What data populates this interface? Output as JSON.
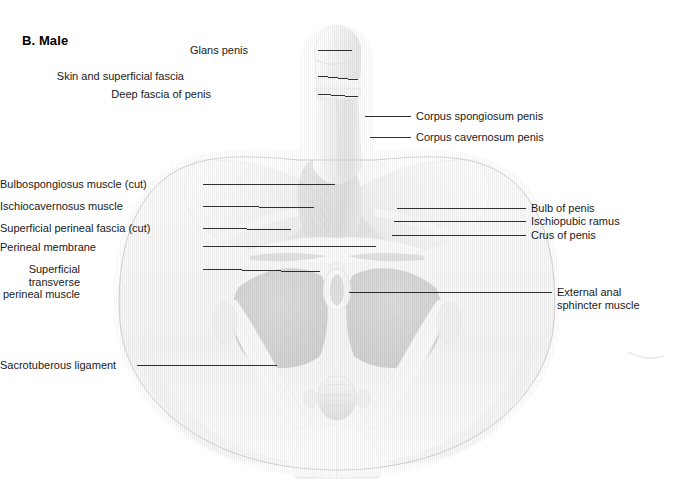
{
  "figure": {
    "panel_title": "B. Male",
    "background_color": "#ffffff",
    "leader_line_color": "#1a1a1a",
    "illustration_tone_light": "#f0f0f0",
    "illustration_tone_mid": "#b5b5b5",
    "illustration_tone_dark": "#6a6a6a"
  },
  "labels_left": [
    {
      "name": "glans-penis",
      "text": "Glans penis",
      "x": 248,
      "y": 44,
      "leader": {
        "x1": 318,
        "y1": 50,
        "x2": 352,
        "y2": 50
      }
    },
    {
      "name": "skin-and-superficial-fascia",
      "text": "Skin and superficial fascia",
      "x": 184,
      "y": 70,
      "leader": {
        "x1": 318,
        "y1": 76,
        "x2": 358,
        "y2": 80
      }
    },
    {
      "name": "deep-fascia-of-penis",
      "text": "Deep fascia of penis",
      "x": 211,
      "y": 88,
      "leader": {
        "x1": 318,
        "y1": 94,
        "x2": 358,
        "y2": 97
      }
    },
    {
      "name": "bulbospongiosus-muscle-cut",
      "text": "Bulbospongiosus muscle (cut)",
      "x": 46,
      "y": 178,
      "leader": {
        "x1": 203,
        "y1": 184,
        "x2": 335,
        "y2": 184
      }
    },
    {
      "name": "ischiocavernosus-muscle",
      "text": "Ischiocavernosus muscle",
      "x": 69,
      "y": 200,
      "leader": {
        "x1": 203,
        "y1": 206,
        "x2": 314,
        "y2": 208
      }
    },
    {
      "name": "superficial-perineal-fascia-cut",
      "text": "Superficial perineal fascia (cut)",
      "x": 39,
      "y": 222,
      "leader": {
        "x1": 203,
        "y1": 228,
        "x2": 291,
        "y2": 230
      }
    },
    {
      "name": "perineal-membrane",
      "text": "Perineal membrane",
      "x": 90,
      "y": 241,
      "leader": {
        "x1": 203,
        "y1": 247,
        "x2": 376,
        "y2": 246
      }
    },
    {
      "name": "superficial-transverse-perineal-muscle",
      "text": "Superficial transverse\nperineal muscle",
      "x": 80,
      "y": 263,
      "leader": {
        "x1": 203,
        "y1": 269,
        "x2": 320,
        "y2": 272
      }
    },
    {
      "name": "sacrotuberous-ligament",
      "text": "Sacrotuberous ligament",
      "x": 22,
      "y": 359,
      "leader": {
        "x1": 137,
        "y1": 365,
        "x2": 277,
        "y2": 365
      }
    }
  ],
  "labels_right": [
    {
      "name": "corpus-spongiosum-penis",
      "text": "Corpus spongiosum penis",
      "x": 416,
      "y": 110,
      "leader": {
        "x1": 365,
        "y1": 116,
        "x2": 411,
        "y2": 116
      }
    },
    {
      "name": "corpus-cavernosum-penis",
      "text": "Corpus cavernosum penis",
      "x": 416,
      "y": 131,
      "leader": {
        "x1": 370,
        "y1": 137,
        "x2": 411,
        "y2": 137
      }
    },
    {
      "name": "bulb-of-penis",
      "text": "Bulb of penis",
      "x": 531,
      "y": 202,
      "leader": {
        "x1": 397,
        "y1": 208,
        "x2": 526,
        "y2": 208
      }
    },
    {
      "name": "ischiopubic-ramus",
      "text": "Ischiopubic ramus",
      "x": 531,
      "y": 215,
      "leader": {
        "x1": 394,
        "y1": 222,
        "x2": 526,
        "y2": 221
      }
    },
    {
      "name": "crus-of-penis",
      "text": "Crus of penis",
      "x": 531,
      "y": 229,
      "leader": {
        "x1": 392,
        "y1": 235,
        "x2": 526,
        "y2": 235
      }
    },
    {
      "name": "external-anal-sphincter-muscle",
      "text": "External anal\nsphincter muscle",
      "x": 557,
      "y": 286,
      "leader": {
        "x1": 349,
        "y1": 292,
        "x2": 552,
        "y2": 292
      }
    }
  ]
}
